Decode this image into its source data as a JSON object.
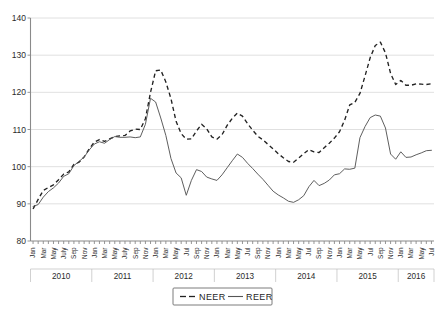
{
  "chart_data": {
    "type": "line",
    "title": "",
    "subtitle": "",
    "xlabel": "",
    "ylabel": "",
    "ylim": [
      80,
      140
    ],
    "yticks": [
      80,
      90,
      100,
      110,
      120,
      130,
      140
    ],
    "ytick_labels": [
      "80",
      "90",
      "100",
      "110",
      "120",
      "130",
      "140"
    ],
    "grid": true,
    "legend_position": "bottom-center",
    "x_major_labels": [
      "2010",
      "2011",
      "2012",
      "2013",
      "2014",
      "2015",
      "2016"
    ],
    "x_tick_labels": [
      "Jan",
      "Mar",
      "May",
      "July",
      "Sep",
      "Nov",
      "Jan",
      "Mar",
      "May",
      "July",
      "Sep",
      "Nov",
      "Jan",
      "Mar",
      "May",
      "Jul",
      "Sep",
      "Nov",
      "Jan",
      "Mar",
      "May",
      "Jul",
      "Sep",
      "Nov",
      "Jan",
      "Mar",
      "May",
      "Jul",
      "Sep",
      "Nov",
      "Jan",
      "Mar",
      "May",
      "Jul",
      "Sep",
      "Nov",
      "Jan",
      "Mar",
      "May",
      "Jul"
    ],
    "x": [
      "2010-01",
      "2010-02",
      "2010-03",
      "2010-04",
      "2010-05",
      "2010-06",
      "2010-07",
      "2010-08",
      "2010-09",
      "2010-10",
      "2010-11",
      "2010-12",
      "2011-01",
      "2011-02",
      "2011-03",
      "2011-04",
      "2011-05",
      "2011-06",
      "2011-07",
      "2011-08",
      "2011-09",
      "2011-10",
      "2011-11",
      "2011-12",
      "2012-01",
      "2012-02",
      "2012-03",
      "2012-04",
      "2012-05",
      "2012-06",
      "2012-07",
      "2012-08",
      "2012-09",
      "2012-10",
      "2012-11",
      "2012-12",
      "2013-01",
      "2013-02",
      "2013-03",
      "2013-04",
      "2013-05",
      "2013-06",
      "2013-07",
      "2013-08",
      "2013-09",
      "2013-10",
      "2013-11",
      "2013-12",
      "2014-01",
      "2014-02",
      "2014-03",
      "2014-04",
      "2014-05",
      "2014-06",
      "2014-07",
      "2014-08",
      "2014-09",
      "2014-10",
      "2014-11",
      "2014-12",
      "2015-01",
      "2015-02",
      "2015-03",
      "2015-04",
      "2015-05",
      "2015-06",
      "2015-07",
      "2015-08",
      "2015-09",
      "2015-10",
      "2015-11",
      "2015-12",
      "2016-01",
      "2016-02",
      "2016-03",
      "2016-04",
      "2016-05",
      "2016-06",
      "2016-07"
    ],
    "series": [
      {
        "name": "NEER",
        "style": "dashed",
        "color": "#222222",
        "values": [
          88.6,
          91.2,
          93.6,
          94.4,
          95.1,
          96.5,
          98.0,
          98.6,
          100.6,
          101.2,
          102.6,
          104.8,
          106.6,
          107.3,
          106.8,
          107.5,
          108.1,
          108.3,
          108.4,
          109.6,
          110.1,
          110.0,
          112.9,
          120.0,
          125.8,
          126.0,
          122.8,
          118.3,
          112.2,
          108.9,
          107.4,
          107.5,
          109.6,
          111.4,
          110.2,
          108.0,
          107.4,
          108.6,
          111.1,
          113.0,
          114.4,
          113.6,
          111.6,
          109.8,
          108.2,
          107.2,
          106.0,
          104.8,
          103.5,
          102.4,
          101.4,
          101.2,
          102.3,
          103.5,
          104.6,
          104.0,
          103.8,
          105.1,
          106.3,
          107.7,
          109.4,
          112.5,
          116.6,
          117.3,
          119.7,
          124.4,
          129.3,
          132.6,
          133.5,
          130.6,
          125.1,
          122.1,
          123.2,
          121.9,
          121.9,
          122.3,
          122.2,
          122.1,
          122.3
        ]
      },
      {
        "name": "REER",
        "style": "solid",
        "color": "#555555",
        "values": [
          89.3,
          89.8,
          91.8,
          93.3,
          94.3,
          95.6,
          97.4,
          98.1,
          100.3,
          101.4,
          102.6,
          104.5,
          106.1,
          106.7,
          106.3,
          107.3,
          108.1,
          107.9,
          107.9,
          108.0,
          107.8,
          108.0,
          111.4,
          118.4,
          117.4,
          113.1,
          108.4,
          102.2,
          98.3,
          97.0,
          92.3,
          96.3,
          99.2,
          98.7,
          97.2,
          96.7,
          96.3,
          97.8,
          99.7,
          101.6,
          103.4,
          102.5,
          100.9,
          99.5,
          98.0,
          96.6,
          95.0,
          93.4,
          92.4,
          91.6,
          90.7,
          90.4,
          91.1,
          92.2,
          94.6,
          96.3,
          94.9,
          95.5,
          96.4,
          97.8,
          98.1,
          99.4,
          99.3,
          99.6,
          107.8,
          110.8,
          113.2,
          113.9,
          113.6,
          110.4,
          103.4,
          102.0,
          104.0,
          102.5,
          102.6,
          103.2,
          103.7,
          104.3,
          104.4
        ]
      }
    ],
    "legend": [
      {
        "label": "NEER",
        "style": "dashed"
      },
      {
        "label": "REER",
        "style": "solid"
      }
    ]
  }
}
